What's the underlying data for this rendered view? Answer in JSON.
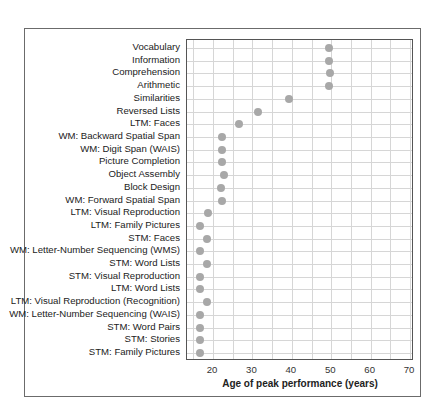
{
  "chart_data": {
    "type": "scatter",
    "title": "",
    "xlabel": "Age of peak performance (years)",
    "ylabel": "",
    "xlim": [
      13.4,
      71
    ],
    "x_ticks": [
      20,
      30,
      40,
      50,
      60,
      70
    ],
    "grid": true,
    "grid_step_x": 5,
    "legend": null,
    "categories": [
      "Vocabulary",
      "Information",
      "Comprehension",
      "Arithmetic",
      "Similarities",
      "Reversed Lists",
      "LTM: Faces",
      "WM: Backward Spatial Span",
      "WM: Digit Span (WAIS)",
      "Picture Completion",
      "Object Assembly",
      "Block Design",
      "WM: Forward Spatial Span",
      "LTM: Visual Reproduction",
      "LTM: Family Pictures",
      "STM: Faces",
      "WM: Letter-Number Sequencing (WMS)",
      "STM: Word Lists",
      "STM: Visual Reproduction",
      "LTM: Word Lists",
      "LTM: Visual Reproduction (Recognition)",
      "WM: Letter-Number Sequencing (WAIS)",
      "STM: Word Pairs",
      "STM: Stories",
      "STM: Family Pictures"
    ],
    "values": [
      49.5,
      49.5,
      49.7,
      49.5,
      39.3,
      31.5,
      26.7,
      22.2,
      22.3,
      22.3,
      22.8,
      22.1,
      22.3,
      18.7,
      16.7,
      18.6,
      16.6,
      18.6,
      16.7,
      16.8,
      18.6,
      16.7,
      16.7,
      16.8,
      16.7
    ],
    "marker_color": "#a8a8a8"
  }
}
